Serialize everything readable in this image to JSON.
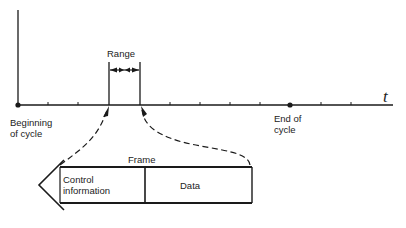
{
  "diagram": {
    "type": "timeline-frame",
    "axis": {
      "label": "t",
      "y": 105,
      "x_start": 18,
      "x_end": 393,
      "tick_positions": [
        48,
        78,
        170,
        200,
        230,
        260,
        321,
        351
      ],
      "markers": [
        {
          "name": "beginning-of-cycle",
          "x": 18
        },
        {
          "name": "end-of-cycle",
          "x": 290
        }
      ]
    },
    "labels": {
      "range": "Range",
      "beginning_line1": "Beginning",
      "beginning_line2": "of cycle",
      "end_line1": "End of",
      "end_line2": "cycle",
      "frame": "Frame",
      "control_line1": "Control",
      "control_line2": "information",
      "data": "Data",
      "t": "t"
    },
    "range": {
      "x_left": 109,
      "x_right": 140,
      "top": 62
    },
    "frame": {
      "left": 60,
      "top": 167,
      "right": 252,
      "bottom": 203,
      "divider": 145
    },
    "colors": {
      "ink": "#1a1a1a",
      "background": "#ffffff"
    }
  }
}
